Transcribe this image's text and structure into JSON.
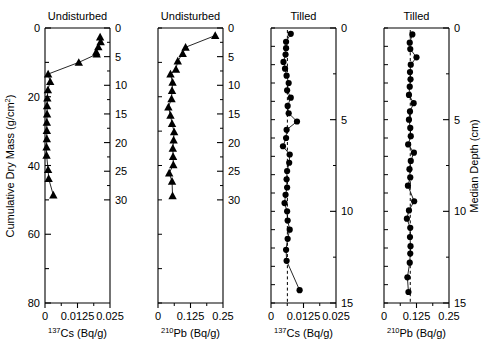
{
  "figure": {
    "background": "#ffffff",
    "line_color": "#000000",
    "marker_color": "#000000",
    "dashed_color": "#000000",
    "left_axis_label": "Cumulative Dry Mass (g/cm2)",
    "right_axis_label": "Median Depth (cm)"
  },
  "axes": {
    "mass_ticks": [
      0,
      20,
      40,
      60,
      80
    ],
    "mass_minor_step": 10,
    "mass_range": [
      0,
      80
    ],
    "depth_undisturbed_ticks": [
      0,
      5,
      10,
      15,
      20,
      25,
      30
    ],
    "depth_undisturbed_range": [
      0,
      30
    ],
    "depth_tilled_ticks": [
      0,
      5,
      10,
      15
    ],
    "depth_tilled_range": [
      0,
      15
    ],
    "cs_ticks": [
      "0",
      "0.0125",
      "0.025"
    ],
    "cs_range": [
      0,
      0.025
    ],
    "pb_ticks": [
      "0",
      "0.125",
      "0.25"
    ],
    "pb_range": [
      0,
      0.25
    ]
  },
  "panels": [
    {
      "id": "undisturbed-cs",
      "title": "Undisturbed",
      "xlabel_pre": "137",
      "xlabel_main": "Cs (Bq/g)",
      "xticks": [
        "0",
        "0.0125",
        "0.025"
      ],
      "xlim": [
        0,
        0.025
      ],
      "ylim": [
        0,
        80
      ],
      "ylabel": "Cumulative Dry Mass (g/cm2)",
      "inner_axis_ticks": [
        0,
        5,
        10,
        15,
        20,
        25,
        30
      ],
      "marker": "triangle",
      "has_dashed_mean": false,
      "chart_data": {
        "type": "line",
        "x": [
          0.0212,
          0.0214,
          0.0205,
          0.0197,
          0.0199,
          0.013,
          0.0012,
          0.002,
          0.0011,
          0.0009,
          0.0008,
          0.0008,
          0.0007,
          0.0007,
          0.0007,
          0.0006,
          0.0006,
          0.0012,
          0.0014,
          0.0032
        ],
        "y": [
          2.6,
          4.0,
          5.5,
          7.0,
          7.6,
          10.0,
          13.4,
          15.6,
          18.0,
          20.4,
          22.6,
          25.0,
          27.4,
          29.8,
          32.2,
          34.6,
          37.0,
          41.2,
          43.8,
          48.6
        ]
      }
    },
    {
      "id": "undisturbed-pb",
      "title": "Undisturbed",
      "xlabel_pre": "210",
      "xlabel_main": "Pb (Bq/g)",
      "xticks": [
        "0",
        "0.125",
        "0.25"
      ],
      "xlim": [
        0,
        0.25
      ],
      "ylim": [
        0,
        80
      ],
      "inner_axis_ticks": [
        0,
        5,
        10,
        15,
        20,
        25,
        30
      ],
      "marker": "triangle",
      "has_dashed_mean": false,
      "chart_data": {
        "type": "line",
        "x": [
          0.22,
          0.106,
          0.095,
          0.076,
          0.069,
          0.048,
          0.056,
          0.054,
          0.052,
          0.04,
          0.048,
          0.054,
          0.062,
          0.06,
          0.057,
          0.058,
          0.059,
          0.043,
          0.054,
          0.056
        ],
        "y": [
          2.2,
          5.6,
          7.4,
          9.6,
          12.0,
          13.4,
          15.8,
          18.2,
          20.6,
          23.0,
          25.4,
          27.8,
          30.2,
          32.6,
          35.0,
          37.4,
          39.8,
          42.2,
          44.6,
          48.8
        ]
      }
    },
    {
      "id": "tilled-cs",
      "title": "Tilled",
      "xlabel_pre": "137",
      "xlabel_main": "Cs (Bq/g)",
      "xticks": [
        "0",
        "0.0125",
        "0.025"
      ],
      "xlim": [
        0,
        0.025
      ],
      "ylim": [
        0,
        15
      ],
      "inner_axis_ticks": [
        0,
        5,
        10,
        15
      ],
      "marker": "circle",
      "has_dashed_mean": true,
      "mean_value": 0.0063,
      "chart_data": {
        "type": "line",
        "x": [
          0.0076,
          0.0058,
          0.0058,
          0.0056,
          0.0048,
          0.0054,
          0.006,
          0.0068,
          0.0062,
          0.0076,
          0.0064,
          0.0068,
          0.01,
          0.006,
          0.0058,
          0.0046,
          0.0072,
          0.007,
          0.0062,
          0.006,
          0.0062,
          0.0056,
          0.0052,
          0.0062,
          0.0064,
          0.0072,
          0.0064,
          0.0058,
          0.006,
          0.011
        ],
        "y": [
          0.32,
          0.75,
          1.1,
          1.45,
          1.85,
          2.22,
          2.6,
          3.0,
          3.4,
          3.8,
          4.25,
          4.65,
          5.1,
          5.55,
          6.0,
          6.45,
          6.9,
          7.35,
          7.8,
          8.25,
          8.7,
          9.1,
          9.55,
          10.0,
          10.5,
          11.0,
          11.5,
          12.1,
          12.7,
          14.3
        ]
      }
    },
    {
      "id": "tilled-pb",
      "title": "Tilled",
      "xlabel_pre": "210",
      "xlabel_main": "Pb (Bq/g)",
      "xticks": [
        "0",
        "0.125",
        "0.25"
      ],
      "xlim": [
        0,
        0.25
      ],
      "ylim": [
        0,
        15
      ],
      "inner_axis_ticks": [
        0,
        5,
        10,
        15
      ],
      "marker": "circle",
      "has_dashed_mean": true,
      "mean_value": 0.101,
      "chart_data": {
        "type": "line",
        "x": [
          0.109,
          0.099,
          0.101,
          0.125,
          0.103,
          0.1,
          0.102,
          0.099,
          0.096,
          0.114,
          0.1,
          0.096,
          0.101,
          0.103,
          0.093,
          0.115,
          0.103,
          0.098,
          0.101,
          0.092,
          0.116,
          0.096,
          0.088,
          0.101,
          0.1,
          0.102,
          0.101,
          0.099,
          0.09,
          0.094
        ],
        "y": [
          0.35,
          0.8,
          1.15,
          1.6,
          2.0,
          2.4,
          2.8,
          3.2,
          3.65,
          4.1,
          4.55,
          5.0,
          5.45,
          5.9,
          6.35,
          6.8,
          7.25,
          7.7,
          8.15,
          8.6,
          9.45,
          9.95,
          10.4,
          10.9,
          11.4,
          11.9,
          12.3,
          12.8,
          13.6,
          14.4
        ]
      }
    }
  ]
}
